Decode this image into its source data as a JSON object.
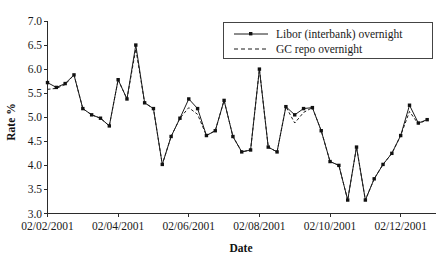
{
  "figure": {
    "background": "#ffffff",
    "ink_color": "#1b1b1b"
  },
  "chart_data": {
    "type": "line",
    "title": "",
    "xlabel": "Date",
    "ylabel": "Rate %",
    "ylim": [
      3.0,
      7.0
    ],
    "ytick_step": 0.5,
    "yticks": [
      "7.0",
      "6.5",
      "6.0",
      "5.5",
      "5.0",
      "4.5",
      "4.0",
      "3.5",
      "3.0"
    ],
    "ytick_values": [
      7.0,
      6.5,
      6.0,
      5.5,
      5.0,
      4.5,
      4.0,
      3.5,
      3.0
    ],
    "xticks": [
      "02/02/2001",
      "02/04/2001",
      "02/06/2001",
      "02/08/2001",
      "02/10/2001",
      "02/12/2001"
    ],
    "xtick_index": [
      0,
      8,
      16,
      24,
      32,
      40
    ],
    "xlim_index": [
      0,
      44
    ],
    "grid": false,
    "legend_position": "top-right",
    "series": [
      {
        "name": "Libor (interbank) overnight",
        "style": "solid",
        "marker": "square",
        "values": [
          5.72,
          5.62,
          5.7,
          5.88,
          5.18,
          5.05,
          4.98,
          4.82,
          5.78,
          5.38,
          6.5,
          5.3,
          5.18,
          4.02,
          4.6,
          4.98,
          5.38,
          5.18,
          4.62,
          4.72,
          5.35,
          4.6,
          4.28,
          4.32,
          6.0,
          4.38,
          4.28,
          5.22,
          5.05,
          5.18,
          5.2,
          4.72,
          4.08,
          4.0,
          3.28,
          4.38,
          3.28,
          3.72,
          4.02,
          4.25,
          4.62,
          5.25,
          4.88,
          4.95
        ]
      },
      {
        "name": "GC repo overnight",
        "style": "dashed",
        "marker": "none",
        "values": [
          5.58,
          5.6,
          5.68,
          5.88,
          5.18,
          5.05,
          4.98,
          4.82,
          5.78,
          5.38,
          6.42,
          5.3,
          5.18,
          4.02,
          4.6,
          4.98,
          5.2,
          5.06,
          4.62,
          4.72,
          5.35,
          4.6,
          4.28,
          4.32,
          6.0,
          4.38,
          4.28,
          5.22,
          4.88,
          5.1,
          5.2,
          4.72,
          4.08,
          4.0,
          3.28,
          4.38,
          3.28,
          3.72,
          4.02,
          4.25,
          4.62,
          5.12,
          4.86,
          4.95
        ]
      }
    ]
  },
  "legend": {
    "entries": [
      {
        "label": "Libor (interbank) overnight",
        "style": "solid"
      },
      {
        "label": "GC repo overnight",
        "style": "dashed"
      }
    ]
  }
}
